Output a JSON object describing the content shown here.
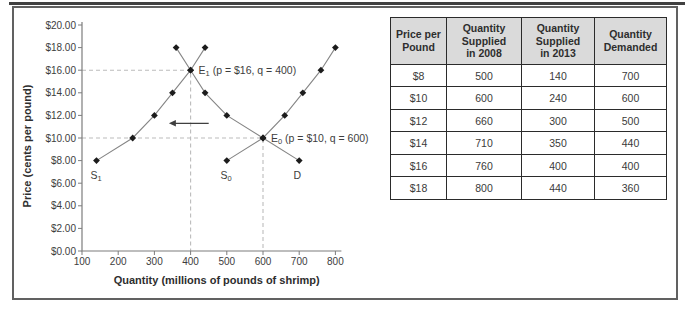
{
  "chart_data": {
    "type": "line",
    "title": "",
    "xlabel": "Quantity (millions of pounds of shrimp)",
    "ylabel": "Price (cents per pound)",
    "xlim": [
      100,
      800
    ],
    "ylim": [
      0,
      20
    ],
    "grid": "off",
    "x_ticks": [
      {
        "value": 100,
        "label": "100"
      },
      {
        "value": 200,
        "label": "200"
      },
      {
        "value": 300,
        "label": "300"
      },
      {
        "value": 400,
        "label": "400"
      },
      {
        "value": 500,
        "label": "500"
      },
      {
        "value": 600,
        "label": "600"
      },
      {
        "value": 700,
        "label": "700"
      },
      {
        "value": 800,
        "label": "800"
      }
    ],
    "y_ticks": [
      {
        "value": 0,
        "label": "$0.00"
      },
      {
        "value": 2,
        "label": "$2.00"
      },
      {
        "value": 4,
        "label": "$4.00"
      },
      {
        "value": 6,
        "label": "$6.00"
      },
      {
        "value": 8,
        "label": "$8.00"
      },
      {
        "value": 10,
        "label": "$10.00"
      },
      {
        "value": 12,
        "label": "$12.00"
      },
      {
        "value": 14,
        "label": "$14.00"
      },
      {
        "value": 16,
        "label": "$16.00"
      },
      {
        "value": 18,
        "label": "$18.00"
      },
      {
        "value": 20,
        "label": "$20.00"
      }
    ],
    "series": [
      {
        "name": "S1",
        "label_main": "S",
        "label_sub": "1",
        "points": [
          [
            140,
            8
          ],
          [
            240,
            10
          ],
          [
            300,
            12
          ],
          [
            350,
            14
          ],
          [
            400,
            16
          ],
          [
            440,
            18
          ]
        ],
        "label_pos": {
          "q": 139,
          "p": 6.4
        }
      },
      {
        "name": "S0",
        "label_main": "S",
        "label_sub": "0",
        "points": [
          [
            500,
            8
          ],
          [
            600,
            10
          ],
          [
            660,
            12
          ],
          [
            710,
            14
          ],
          [
            760,
            16
          ],
          [
            800,
            18
          ]
        ],
        "label_pos": {
          "q": 498,
          "p": 6.4
        }
      },
      {
        "name": "D",
        "label_main": "D",
        "label_sub": "",
        "points": [
          [
            700,
            8
          ],
          [
            600,
            10
          ],
          [
            500,
            12
          ],
          [
            440,
            14
          ],
          [
            400,
            16
          ],
          [
            360,
            18
          ]
        ],
        "label_pos": {
          "q": 695,
          "p": 6.4
        }
      }
    ],
    "equilibria": [
      {
        "name": "E1",
        "label_main": "E",
        "label_sub": "1",
        "label_rest": " (p = $16, q = 400)",
        "p": 16,
        "q": 400
      },
      {
        "name": "E0",
        "label_main": "E",
        "label_sub": "0",
        "label_rest": " (p = $10, q = 600)",
        "p": 10,
        "q": 600
      }
    ],
    "shift_arrow": {
      "at_p": 11.3,
      "from_q": 450,
      "to_q": 340,
      "direction": "left"
    },
    "colors": {
      "line": "#858585",
      "marker": "#1c1c1c",
      "dashed": "#bcbcbc",
      "axis": "#7d7d7d",
      "text": "#3d3d3d",
      "title_text": "#2e2e2e",
      "arrow": "#3f3f3f"
    }
  },
  "table": {
    "headers": [
      "Price per\nPound",
      "Quantity\nSupplied\nin 2008",
      "Quantity\nSupplied\nin 2013",
      "Quantity\nDemanded"
    ],
    "rows": [
      [
        "$8",
        "500",
        "140",
        "700"
      ],
      [
        "$10",
        "600",
        "240",
        "600"
      ],
      [
        "$12",
        "660",
        "300",
        "500"
      ],
      [
        "$14",
        "710",
        "350",
        "440"
      ],
      [
        "$16",
        "760",
        "400",
        "400"
      ],
      [
        "$18",
        "800",
        "440",
        "360"
      ]
    ],
    "header_bg": "#dadada",
    "border_color": "#2b2b2b",
    "col_widths": [
      56,
      75,
      73,
      72
    ]
  }
}
